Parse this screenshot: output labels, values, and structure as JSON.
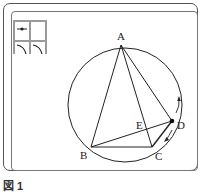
{
  "figure": {
    "caption": "図 1",
    "points": {
      "A": {
        "label": "A",
        "x": 121,
        "y": 45
      },
      "B": {
        "label": "B",
        "x": 91,
        "y": 147
      },
      "C": {
        "label": "C",
        "x": 152,
        "y": 147
      },
      "D": {
        "label": "D",
        "x": 172,
        "y": 121
      },
      "E": {
        "label": "E",
        "x": 148,
        "y": 128
      }
    },
    "circle": {
      "cx": 125,
      "cy": 105,
      "r": 57
    },
    "toolbox": {
      "tools": [
        {
          "name": "point-tool"
        },
        {
          "name": "blank-tool"
        },
        {
          "name": "arc-tool-left"
        },
        {
          "name": "arc-tool-right"
        }
      ]
    },
    "colors": {
      "line": "#222222",
      "frame": "#555555",
      "toolbox": "#9a9a9a"
    }
  }
}
